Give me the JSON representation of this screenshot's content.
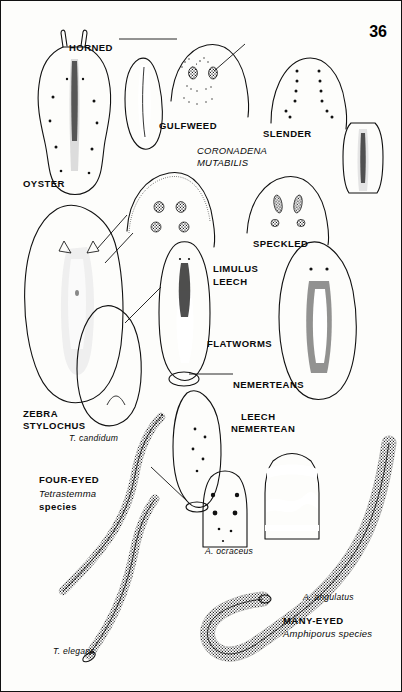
{
  "plate": {
    "page_number": "36",
    "group_labels": [
      "FLATWORMS",
      "NEMERTEANS"
    ]
  },
  "labels": {
    "horned": "HORNED",
    "gulfweed": "GULFWEED",
    "slender": "SLENDER",
    "coronadena": "CORONADENA",
    "mutabilis": "MUTABILIS",
    "oyster": "OYSTER",
    "speckled": "SPECKLED",
    "limulus": "LIMULUS",
    "leech": "LEECH",
    "flatworms": "FLATWORMS",
    "nemerteans": "NEMERTEANS",
    "zebra": "ZEBRA",
    "stylochus": "STYLOCHUS",
    "leech_nemertean_1": "LEECH",
    "leech_nemertean_2": "NEMERTEAN",
    "t_candidum": "T. candidum",
    "four_eyed": "FOUR-EYED",
    "tetrastemma": "Tetrastemma",
    "species_1": "species",
    "t_elegans": "T. elegans",
    "a_ocraceus": "A. ocraceus",
    "a_angulatus": "A. angulatus",
    "many_eyed": "MANY-EYED",
    "amphiporus": "Amphiporus species"
  },
  "colors": {
    "ink": "#111111",
    "paper": "#fdfdfb"
  }
}
